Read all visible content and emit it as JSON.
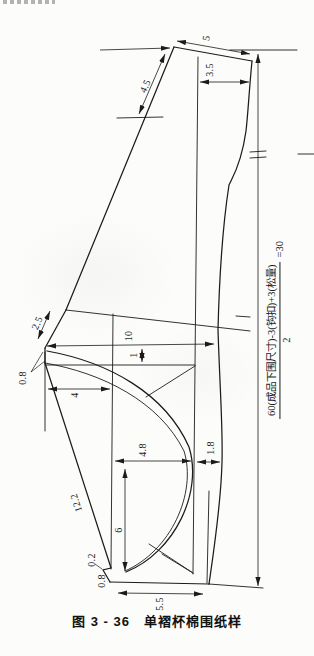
{
  "page": {
    "caption": "图 3 - 36　单褶杯棉围纸样"
  },
  "formula": {
    "numerator": "60(成品下围尺寸)-3(钩扣)+3(松量)",
    "denominator": "2",
    "result": "=30"
  },
  "labels": {
    "top_edge": "5",
    "hook_width": "3.5",
    "upper_slant": "4.5",
    "corner_slant": "2.5",
    "gap_top": "0.8",
    "band_length": "10",
    "band_drop": "1",
    "cup_top_width": "4",
    "cup_bottom_width": "4.8",
    "side_width": "1.8",
    "left_slant": "12.2",
    "cup_height": "6",
    "notch_small": "0.2",
    "notch_bottom": "0.8",
    "bottom_width": "5.5"
  }
}
